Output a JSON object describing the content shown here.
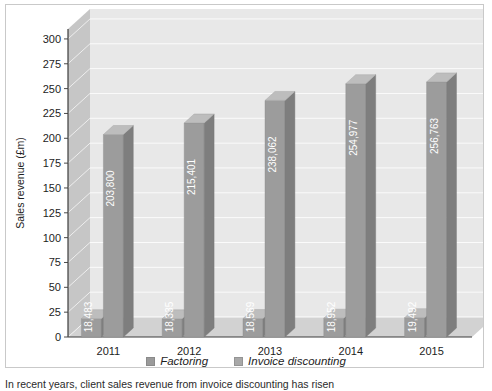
{
  "chart_data": {
    "type": "bar",
    "title": "",
    "subtitle": "",
    "xlabel": "",
    "ylabel": "Sales revenue (£m)",
    "categories": [
      "2011",
      "2012",
      "2013",
      "2014",
      "2015"
    ],
    "ylim": [
      0,
      310
    ],
    "yticks": [
      0,
      25,
      50,
      75,
      100,
      125,
      150,
      175,
      200,
      225,
      250,
      275,
      300
    ],
    "ytick_labels": [
      "0",
      "25",
      "50",
      "75",
      "100",
      "125",
      "150",
      "175",
      "200",
      "225",
      "250",
      "275",
      "300"
    ],
    "grid": true,
    "legend_position": "bottom",
    "style": "3d-grouped-column",
    "series": [
      {
        "name": "Factoring",
        "color": "#9a9a9a",
        "values": [
          18.483,
          18.335,
          18.569,
          18.952,
          19.492
        ],
        "data_labels": [
          "18,483",
          "18,335",
          "18,569",
          "18,952",
          "19,492"
        ]
      },
      {
        "name": "Invoice discounting",
        "color": "#a8a8a8",
        "values": [
          203.8,
          215.401,
          238.062,
          254.977,
          256.763
        ],
        "data_labels": [
          "203,800",
          "215,401",
          "238,062",
          "254,977",
          "256,763"
        ]
      }
    ]
  },
  "legend": {
    "items": [
      {
        "label": "Factoring",
        "color": "#9a9a9a"
      },
      {
        "label": "Invoice discounting",
        "color": "#a8a8a8"
      }
    ]
  },
  "caption": {
    "text": "In recent years, client sales revenue from invoice discounting has risen"
  },
  "colors": {
    "bar_front": "#9c9c9c",
    "bar_side": "#7e7e7e",
    "bar_top": "#bdbdbd",
    "wall_back": "#e8e8e8",
    "wall_left": "#c6c6c6",
    "floor": "#d2d2d2",
    "gridline": "#f4f4f4",
    "frame": "#c9c9c9",
    "text": "#1d1d1d",
    "value_text": "#ffffff"
  }
}
